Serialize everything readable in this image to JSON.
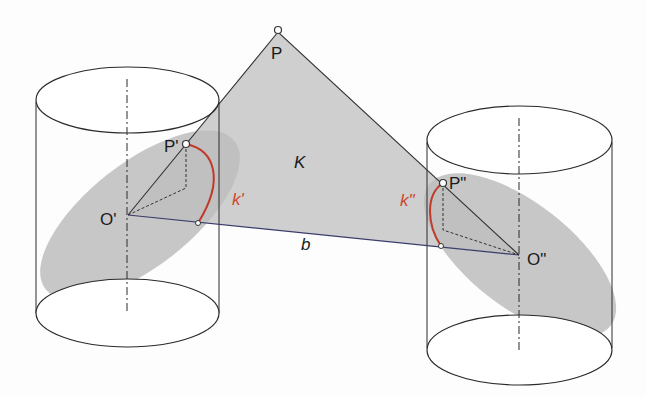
{
  "diagram": {
    "type": "geometry-3d",
    "colors": {
      "outline": "#2a2a2a",
      "triangle_fill": "#cfcfcf",
      "ellipse_fill": "#bdbdbd",
      "arc": "#c0392b",
      "arc_label": "#d0452c",
      "edge_blue": "#3a3d6a"
    },
    "labels": {
      "P": "P",
      "P1": "P'",
      "P2": "P\"",
      "O1": "O'",
      "O2": "O\"",
      "K": "K",
      "k1": "k'",
      "k2": "k\"",
      "b": "b"
    },
    "points": {
      "P": [
        278,
        32
      ],
      "P1": [
        186,
        144
      ],
      "P2": [
        443,
        183
      ],
      "O1": [
        128,
        215
      ],
      "O2": [
        519,
        255
      ],
      "k1_end": [
        198,
        223
      ],
      "k2_end": [
        441,
        246
      ]
    }
  }
}
